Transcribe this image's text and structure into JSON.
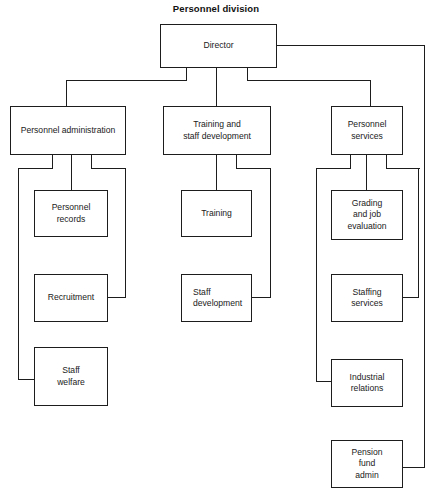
{
  "diagram": {
    "title": "Personnel division",
    "type": "organizational-chart",
    "nodes": {
      "director": {
        "label": "Director",
        "level": 0
      },
      "personnel_administration": {
        "label": "Personnel administration",
        "level": 1
      },
      "training_and_staff_development": {
        "label": "Training and\nstaff development",
        "level": 1
      },
      "personnel_services": {
        "label": "Personnel\nservices",
        "level": 1
      },
      "personnel_records": {
        "label": "Personnel\nrecords",
        "level": 2
      },
      "recruitment": {
        "label": "Recruitment",
        "level": 2
      },
      "staff_welfare": {
        "label": "Staff\nwelfare",
        "level": 2
      },
      "training": {
        "label": "Training",
        "level": 2
      },
      "staff_development": {
        "label": "Staff\ndevelopment",
        "level": 2
      },
      "grading_and_job_evaluation": {
        "label": "Grading\nand job\nevaluation",
        "level": 2
      },
      "staffing_services": {
        "label": "Staffing\nservices",
        "level": 2
      },
      "industrial_relations": {
        "label": "Industrial\nrelations",
        "level": 2
      },
      "pension_fund_admin": {
        "label": "Pension\nfund\nadmin",
        "level": 2
      }
    },
    "edges": [
      {
        "from": "director",
        "to": "personnel_administration"
      },
      {
        "from": "director",
        "to": "training_and_staff_development"
      },
      {
        "from": "director",
        "to": "personnel_services"
      },
      {
        "from": "director",
        "to": "pension_fund_admin"
      },
      {
        "from": "personnel_administration",
        "to": "personnel_records"
      },
      {
        "from": "personnel_administration",
        "to": "recruitment"
      },
      {
        "from": "personnel_administration",
        "to": "staff_welfare"
      },
      {
        "from": "training_and_staff_development",
        "to": "training"
      },
      {
        "from": "training_and_staff_development",
        "to": "staff_development"
      },
      {
        "from": "personnel_services",
        "to": "grading_and_job_evaluation"
      },
      {
        "from": "personnel_services",
        "to": "staffing_services"
      },
      {
        "from": "personnel_services",
        "to": "industrial_relations"
      }
    ],
    "colors": {
      "box_border": "#1d1d1d",
      "connector": "#1d1d1d",
      "background": "#ffffff",
      "text": "#1a1a1a"
    }
  }
}
